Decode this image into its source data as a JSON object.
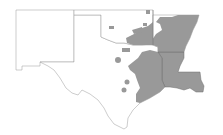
{
  "map": {
    "type": "choropleth",
    "region": "South Central United States",
    "states": [
      "New Mexico",
      "Texas",
      "Oklahoma",
      "Arkansas",
      "Louisiana"
    ],
    "colors": {
      "background": "#ffffff",
      "outline": "#9a9a9a",
      "shaded": "#999999",
      "border_dark": "#6e6e6e"
    },
    "legend": null
  }
}
